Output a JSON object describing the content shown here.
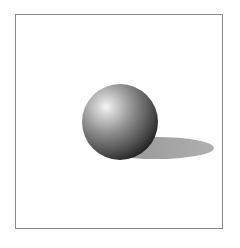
{
  "scene": {
    "description": "3D-rendered shaded sphere with cast shadow inside a framed box",
    "frame": {
      "border_color": "#8a8a8a",
      "background": "#ffffff"
    },
    "sphere": {
      "cx": 120,
      "cy": 122,
      "r": 38,
      "highlight_color": "#f4f4f4",
      "mid_color": "#8c8c8c",
      "dark_color": "#2a2a2a"
    },
    "shadow": {
      "cx": 156,
      "cy": 148,
      "rx": 58,
      "ry": 11,
      "color": "#9a9a9a"
    }
  }
}
